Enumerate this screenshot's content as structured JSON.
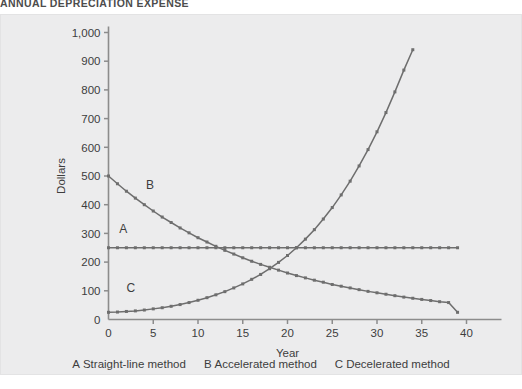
{
  "title": "ANNUAL DEPRECIATION EXPENSE",
  "colors": {
    "panel_background": "#ececed",
    "axis": "#8c8c8c",
    "series_line": "#6e6e6e",
    "text": "#3d3d3d",
    "title_text": "#4c4c4c"
  },
  "legend": {
    "entries": [
      {
        "key": "A",
        "label": "Straight-line method"
      },
      {
        "key": "B",
        "label": "Accelerated method"
      },
      {
        "key": "C",
        "label": "Decelerated method"
      }
    ]
  },
  "plot_tags": {
    "a": "A",
    "b": "B",
    "c": "C"
  },
  "chart_data": {
    "type": "line",
    "title": "ANNUAL DEPRECIATION EXPENSE",
    "xlabel": "Year",
    "ylabel": "Dollars",
    "xlim": [
      0,
      40
    ],
    "ylim": [
      0,
      1000
    ],
    "xticks": [
      0,
      5,
      10,
      15,
      20,
      25,
      30,
      35,
      40
    ],
    "xtick_labels": [
      "0",
      "5",
      "10",
      "15",
      "20",
      "25",
      "30",
      "35",
      "40"
    ],
    "yticks": [
      0,
      100,
      200,
      300,
      400,
      500,
      600,
      700,
      800,
      900,
      1000
    ],
    "ytick_labels": [
      "0",
      "100",
      "200",
      "300",
      "400",
      "500",
      "600",
      "700",
      "800",
      "900",
      "1,000"
    ],
    "grid": false,
    "legend_position": "below",
    "markers": "square",
    "x": [
      0,
      1,
      2,
      3,
      4,
      5,
      6,
      7,
      8,
      9,
      10,
      11,
      12,
      13,
      14,
      15,
      16,
      17,
      18,
      19,
      20,
      21,
      22,
      23,
      24,
      25,
      26,
      27,
      28,
      29,
      30,
      31,
      32,
      33,
      34,
      35,
      36,
      37,
      38,
      39
    ],
    "series": [
      {
        "name": "A Straight-line method",
        "key": "A",
        "values": [
          250,
          250,
          250,
          250,
          250,
          250,
          250,
          250,
          250,
          250,
          250,
          250,
          250,
          250,
          250,
          250,
          250,
          250,
          250,
          250,
          250,
          250,
          250,
          250,
          250,
          250,
          250,
          250,
          250,
          250,
          250,
          250,
          250,
          250,
          250,
          250,
          250,
          250,
          250,
          250
        ]
      },
      {
        "name": "B Accelerated method",
        "key": "B",
        "values": [
          500,
          473,
          447,
          423,
          400,
          378,
          357,
          338,
          319,
          302,
          285,
          270,
          255,
          241,
          228,
          215,
          203,
          192,
          182,
          172,
          162,
          153,
          145,
          137,
          130,
          122,
          116,
          110,
          104,
          98,
          93,
          88,
          83,
          78,
          74,
          70,
          66,
          62,
          59,
          25
        ]
      },
      {
        "name": "C Decelerated method",
        "key": "C",
        "values": [
          25,
          26,
          28,
          30,
          33,
          37,
          41,
          46,
          52,
          59,
          67,
          76,
          86,
          97,
          110,
          124,
          140,
          157,
          177,
          199,
          223,
          250,
          280,
          313,
          350,
          390,
          434,
          482,
          535,
          592,
          654,
          721,
          793,
          869,
          940,
          940,
          940,
          940,
          940,
          940
        ]
      }
    ]
  }
}
